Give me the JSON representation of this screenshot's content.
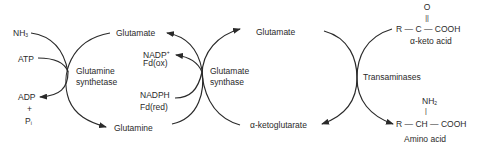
{
  "diagram": {
    "stroke_color": "#2a2a2a",
    "text_color": "#2a2a2a",
    "glutamine_synthetase": {
      "enzyme": [
        "Glutamine",
        "synthetase"
      ],
      "inputs": {
        "nh3": "NH",
        "nh3_sub": "3",
        "atp": "ATP"
      },
      "outputs": {
        "adp": "ADP",
        "plus": "+",
        "pi": "P",
        "pi_sub": "i"
      },
      "substrate": "Glutamate",
      "product": "Glutamine"
    },
    "glutamate_synthase": {
      "enzyme": [
        "Glutamate",
        "synthase"
      ],
      "cofactors_out": {
        "nadp": "NADP",
        "nadp_sup": "+",
        "fd_ox": "Fd(ox)"
      },
      "cofactors_in": {
        "nadph": "NADPH",
        "fd_red": "Fd(red)"
      },
      "product": "Glutamate",
      "substrate_label": "α-ketoglutarate"
    },
    "transaminases": {
      "enzyme": "Transaminases",
      "keto_acid": {
        "oxygen": "O",
        "double_bond": "||",
        "formula_left": "R",
        "dash1": "—",
        "carbon": "C",
        "dash2": "—",
        "formula_right": "COOH",
        "name": "α-keto acid"
      },
      "amino_acid": {
        "amine": "NH",
        "amine_sub": "2",
        "single_bond": "|",
        "formula_left": "R",
        "dash1": "—",
        "carbon": "CH",
        "dash2": "—",
        "formula_right": "COOH",
        "name": "Amino acid"
      }
    }
  }
}
